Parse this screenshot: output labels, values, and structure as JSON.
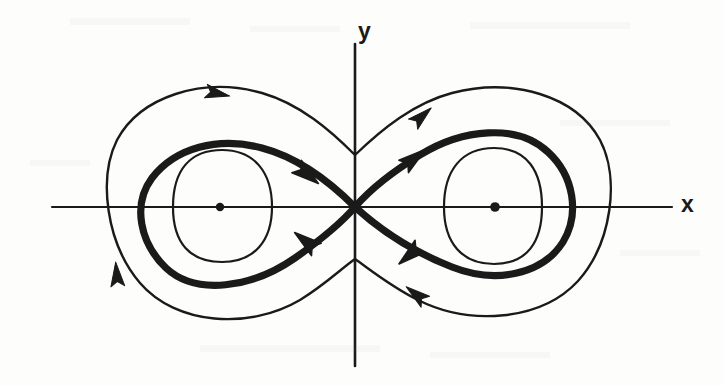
{
  "figure": {
    "type": "phase-portrait",
    "title": "",
    "background_color": "#fdfdfc",
    "stroke_color": "#1a1a1a",
    "axes": {
      "x_label": "x",
      "y_label": "y",
      "x_axis": {
        "x1": 52,
        "y1": 207,
        "x2": 672,
        "y2": 207,
        "stroke_width": 2.2
      },
      "y_axis": {
        "x1": 355,
        "y1": 44,
        "x2": 355,
        "y2": 366,
        "stroke_width": 2.6
      }
    }
  },
  "chart_data": {
    "type": "line",
    "title": "",
    "xlabel": "x",
    "ylabel": "y",
    "grid": false,
    "legend": null,
    "annotations": [
      {
        "name": "saddle-point",
        "label": "",
        "x": 355,
        "y": 207,
        "kind": "saddle"
      },
      {
        "name": "left-center",
        "label": "",
        "x": 220,
        "y": 207,
        "kind": "center"
      },
      {
        "name": "right-center",
        "label": "",
        "x": 495,
        "y": 207,
        "kind": "center"
      }
    ],
    "fixed_points": [
      {
        "id": "left-center",
        "cx": 220,
        "cy": 207,
        "r": 4.2
      },
      {
        "id": "right-center",
        "cx": 495,
        "cy": 207,
        "r": 4.8
      }
    ],
    "series": [
      {
        "name": "inner-orbit-left",
        "stroke_width": 2.2,
        "closed": true,
        "path": "M 173,207 C 173,170 190,150 222,150 C 254,150 272,172 272,207 C 272,241 254,262 222,262 C 190,262 173,243 173,207 Z"
      },
      {
        "name": "inner-orbit-right",
        "stroke_width": 2.2,
        "closed": true,
        "path": "M 444,207 C 444,170 462,148 494,148 C 527,148 542,171 542,207 C 542,242 527,264 494,264 C 462,264 444,243 444,207 Z"
      },
      {
        "name": "separatrix-figure-eight",
        "stroke_width": 7.2,
        "closed": true,
        "path": "M 355,207 C 330,182 300,158 262,148 C 218,136 175,148 152,178 C 132,205 140,243 166,268 C 196,296 252,288 295,258 C 322,239 342,222 355,207 C 368,192 392,172 420,155 C 462,129 517,123 548,152 C 574,176 580,214 563,242 C 542,275 495,284 452,267 C 411,251 378,228 355,207 Z"
      },
      {
        "name": "outer-orbit",
        "stroke_width": 2.4,
        "closed": true,
        "path": "M 355,155 C 330,130 300,104 262,93 C 202,76 140,97 117,140 C 98,178 106,243 140,283 C 176,325 249,330 300,300 C 326,284 342,268 355,259 C 368,268 390,286 418,300 C 470,326 541,321 578,281 C 612,243 620,178 600,140 C 576,96 513,77 452,93 C 414,103 382,129 355,155 Z"
      }
    ],
    "direction_arrows": [
      {
        "name": "arrow-outer-top-left",
        "x": 215,
        "y": 93,
        "angle": 12,
        "size": 15,
        "stroke_width": 2.4
      },
      {
        "name": "arrow-outer-top-right",
        "x": 420,
        "y": 118,
        "angle": -42,
        "size": 15,
        "stroke_width": 2.4
      },
      {
        "name": "arrow-outer-left",
        "x": 117,
        "y": 277,
        "angle": -95,
        "size": 15,
        "stroke_width": 2.4
      },
      {
        "name": "arrow-outer-bottom-right",
        "x": 418,
        "y": 296,
        "angle": 218,
        "size": 15,
        "stroke_width": 2.4
      },
      {
        "name": "arrow-separatrix-upper-left-inbound",
        "x": 305,
        "y": 173,
        "angle": 38,
        "size": 17,
        "stroke_width": 4.5
      },
      {
        "name": "arrow-separatrix-upper-right-outbound",
        "x": 412,
        "y": 160,
        "angle": -38,
        "size": 17,
        "stroke_width": 4.5
      },
      {
        "name": "arrow-separatrix-lower-left-outbound",
        "x": 308,
        "y": 243,
        "angle": 218,
        "size": 17,
        "stroke_width": 4.5
      },
      {
        "name": "arrow-separatrix-lower-right-inbound",
        "x": 412,
        "y": 253,
        "angle": 140,
        "size": 17,
        "stroke_width": 4.5
      }
    ],
    "xlim": [
      -1.6,
      1.6
    ],
    "ylim": [
      -1.0,
      1.0
    ]
  }
}
